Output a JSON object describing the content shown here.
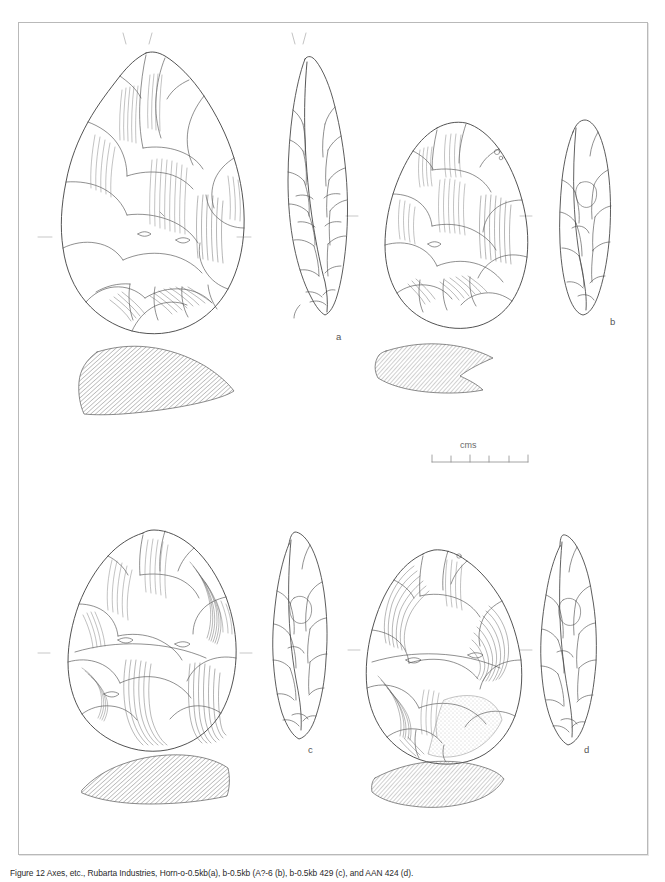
{
  "figure": {
    "type": "archaeological-illustration",
    "border_color": "#b9b9b9",
    "ink_color": "#4a4a4a",
    "background": "#ffffff"
  },
  "specimens": [
    {
      "id": "a",
      "label": "a",
      "views": [
        "face",
        "edge-profile",
        "cross-section"
      ],
      "position": "top-left",
      "shape": "ovate-pointed handaxe"
    },
    {
      "id": "b",
      "label": "b",
      "views": [
        "face",
        "edge-profile",
        "cross-section"
      ],
      "position": "top-right",
      "shape": "sub-triangular handaxe"
    },
    {
      "id": "c",
      "label": "c",
      "views": [
        "face",
        "edge-profile",
        "cross-section"
      ],
      "position": "bottom-left",
      "shape": "ovate handaxe"
    },
    {
      "id": "d",
      "label": "d",
      "views": [
        "face",
        "edge-profile",
        "cross-section"
      ],
      "position": "bottom-right",
      "shape": "ovate handaxe"
    }
  ],
  "scale_bar": {
    "unit_label": "cms",
    "segments": 5,
    "tick_count": 6,
    "length_px": 96
  },
  "caption": {
    "text": "Figure 12 Axes, etc., Rubarta Industries, Horn-o-0.5kb(a), b-0.5kb (A?-6 (b), b-0.5kb 429 (c), and AAN 424 (d)."
  }
}
